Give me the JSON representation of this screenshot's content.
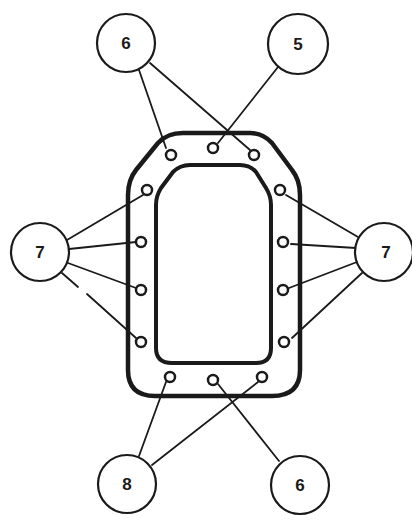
{
  "diagram": {
    "type": "gasket bolt-hole callout diagram",
    "colors": {
      "stroke": "#1a1a1a",
      "background": "#ffffff"
    },
    "callouts": [
      {
        "id": "callout-6-top",
        "label": "6",
        "cx": 126,
        "cy": 43,
        "r": 29,
        "targets": [
          "hole-top-left",
          "hole-top-right"
        ]
      },
      {
        "id": "callout-5",
        "label": "5",
        "cx": 298,
        "cy": 44,
        "r": 30,
        "targets": [
          "hole-top-center"
        ]
      },
      {
        "id": "callout-7-left",
        "label": "7",
        "cx": 40,
        "cy": 252,
        "r": 29,
        "targets": [
          "hole-left-1",
          "hole-left-2",
          "hole-left-3",
          "hole-left-4"
        ]
      },
      {
        "id": "callout-7-right",
        "label": "7",
        "cx": 384,
        "cy": 252,
        "r": 29,
        "targets": [
          "hole-right-1",
          "hole-right-2",
          "hole-right-3",
          "hole-right-4"
        ]
      },
      {
        "id": "callout-8",
        "label": "8",
        "cx": 127,
        "cy": 484,
        "r": 29,
        "targets": [
          "hole-bottom-left",
          "hole-bottom-right"
        ]
      },
      {
        "id": "callout-6-bottom",
        "label": "6",
        "cx": 300,
        "cy": 485,
        "r": 29,
        "targets": [
          "hole-bottom-center"
        ]
      }
    ]
  }
}
